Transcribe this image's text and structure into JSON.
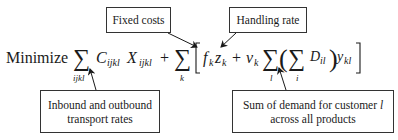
{
  "equation": {
    "lead": "Minimize",
    "sum_symbol": "∑",
    "term1": {
      "sum_index": "ijkl",
      "coef": "C",
      "coef_sub": "ijkl",
      "var": "X",
      "var_sub": "ijkl"
    },
    "plus": "+",
    "term2": {
      "sum_index": "k",
      "open_bracket": "[",
      "fixed": "f",
      "fixed_sub": "k",
      "fixed_var": "z",
      "fixed_var_sub": "k",
      "rate": "v",
      "rate_sub": "k",
      "outer_sum_index": "l",
      "open_paren": "(",
      "inner_sum_index": "i",
      "demand": "D",
      "demand_sub": "il",
      "close_paren": ")",
      "flow": "y",
      "flow_sub": "kl",
      "close_bracket": "]"
    }
  },
  "callouts": {
    "fixed_costs": "Fixed costs",
    "handling_rate": "Handling rate",
    "transport_rates": [
      "Inbound and outbound",
      "transport rates"
    ],
    "demand_sum": [
      "Sum of demand for customer l",
      "across all products"
    ],
    "demand_sum_line1_prefix": "Sum of demand for customer ",
    "demand_sum_line1_var": "l"
  }
}
